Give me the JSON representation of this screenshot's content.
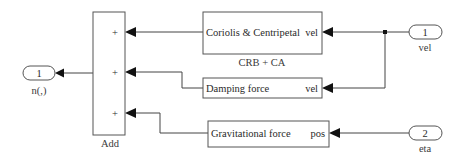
{
  "diagram": {
    "type": "simulink-subsystem",
    "blocks": {
      "add": {
        "label": "Add",
        "inputs": [
          "+",
          "+",
          "+"
        ]
      },
      "coriolis": {
        "title": "Coriolis & Centripetal",
        "port": "vel",
        "label": "CRB + CA"
      },
      "damping": {
        "title": "Damping force",
        "port": "vel"
      },
      "gravity": {
        "title": "Gravitational force",
        "port": "pos"
      },
      "outport_1": {
        "number": "1",
        "label": "n(,)"
      },
      "inport_1": {
        "number": "1",
        "label": "vel"
      },
      "inport_2": {
        "number": "2",
        "label": "eta"
      }
    },
    "connections": [
      {
        "from": "inport_1",
        "to": "coriolis.vel"
      },
      {
        "from": "inport_1",
        "to": "damping.vel"
      },
      {
        "from": "inport_2",
        "to": "gravity.pos"
      },
      {
        "from": "coriolis",
        "to": "add.in1"
      },
      {
        "from": "damping",
        "to": "add.in2"
      },
      {
        "from": "gravity",
        "to": "add.in3"
      },
      {
        "from": "add",
        "to": "outport_1"
      }
    ]
  }
}
